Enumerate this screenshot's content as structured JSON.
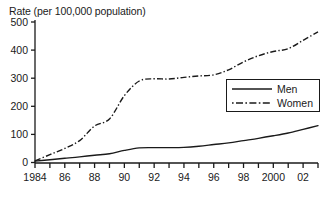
{
  "chart_data": {
    "type": "line",
    "title": "Rate (per 100,000 population)",
    "xlabel": "",
    "ylabel": "",
    "ylim": [
      0,
      500
    ],
    "xlim": [
      1984,
      2003
    ],
    "grid": false,
    "legend_position": "center-right",
    "y_ticks": [
      0,
      100,
      200,
      300,
      400,
      500
    ],
    "y_tick_labels": [
      "0",
      "100",
      "200",
      "300",
      "400",
      "500"
    ],
    "x": [
      1984,
      1985,
      1986,
      1987,
      1988,
      1989,
      1990,
      1991,
      1992,
      1993,
      1994,
      1995,
      1996,
      1997,
      1998,
      1999,
      2000,
      2001,
      2002,
      2003
    ],
    "x_tick_labels": [
      "1984",
      "",
      "86",
      "",
      "88",
      "",
      "90",
      "",
      "92",
      "",
      "94",
      "",
      "96",
      "",
      "98",
      "",
      "2000",
      "",
      "02",
      ""
    ],
    "series": [
      {
        "name": "Men",
        "style": "solid",
        "color": "#1a1a1a",
        "values": [
          5,
          10,
          15,
          20,
          26,
          31,
          43,
          52,
          53,
          53,
          54,
          58,
          64,
          70,
          78,
          86,
          95,
          105,
          118,
          131
        ]
      },
      {
        "name": "Women",
        "style": "dash-dot",
        "color": "#1a1a1a",
        "values": [
          6,
          28,
          50,
          78,
          130,
          155,
          238,
          290,
          298,
          297,
          303,
          308,
          312,
          330,
          358,
          380,
          395,
          405,
          435,
          465
        ]
      }
    ]
  },
  "legend": {
    "entries": [
      {
        "label": "Men",
        "style": "solid"
      },
      {
        "label": "Women",
        "style": "dash-dot"
      }
    ]
  }
}
